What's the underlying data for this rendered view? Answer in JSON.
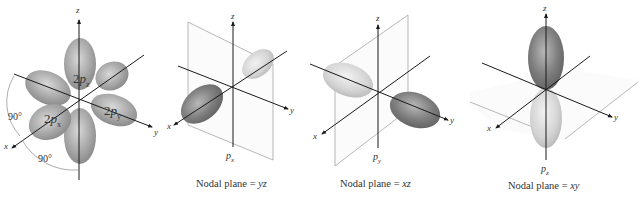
{
  "figure": {
    "panels": [
      {
        "id": "all-2p",
        "axes": {
          "x": "x",
          "y": "y",
          "z": "z"
        },
        "orbital_labels": [
          {
            "prefix": "2",
            "letter": "p",
            "sub": "z"
          },
          {
            "prefix": "2",
            "letter": "p",
            "sub": "x"
          },
          {
            "prefix": "2",
            "letter": "p",
            "sub": "y"
          }
        ],
        "angle_labels": [
          "90°",
          "90°"
        ]
      },
      {
        "id": "px",
        "axes": {
          "x": "x",
          "y": "y",
          "z": "z"
        },
        "orbital_label": {
          "letter": "p",
          "sub": "x"
        },
        "caption": {
          "text": "Nodal plane = ",
          "plane": "yz"
        }
      },
      {
        "id": "py",
        "axes": {
          "x": "x",
          "y": "y",
          "z": "z"
        },
        "orbital_label": {
          "letter": "p",
          "sub": "y"
        },
        "caption": {
          "text": "Nodal plane = ",
          "plane": "xz"
        }
      },
      {
        "id": "pz",
        "axes": {
          "x": "x",
          "y": "y",
          "z": "z"
        },
        "orbital_label": {
          "letter": "p",
          "sub": "z"
        },
        "caption": {
          "text": "Nodal plane = ",
          "plane": "xy"
        }
      }
    ],
    "colors": {
      "lobe_dark": "#6e6e6e",
      "lobe_mid": "#9a9a9a",
      "lobe_light": "#d4d4d4",
      "axis": "#1a1a1a",
      "plane_edge": "#9a9a9a"
    }
  }
}
